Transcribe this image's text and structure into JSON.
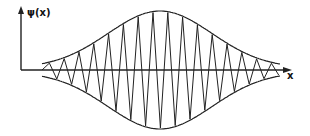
{
  "diagram": {
    "title": "",
    "y_axis_label": "ψ(x)",
    "x_axis_label": "x",
    "colors": {
      "line": "#222222",
      "background": "#ffffff"
    }
  },
  "chart_data": {
    "type": "line",
    "title": "",
    "xlabel": "x",
    "ylabel": "ψ(x)",
    "series": [
      {
        "name": "envelope_upper",
        "shape": "gaussian",
        "center": 0,
        "relative_amplitude": 1
      },
      {
        "name": "envelope_lower",
        "shape": "gaussian",
        "center": 0,
        "relative_amplitude": -1
      },
      {
        "name": "wave",
        "shape": "gaussian-modulated oscillation",
        "approx_cycles_visible": 16
      }
    ],
    "grid": false,
    "legend": null
  }
}
